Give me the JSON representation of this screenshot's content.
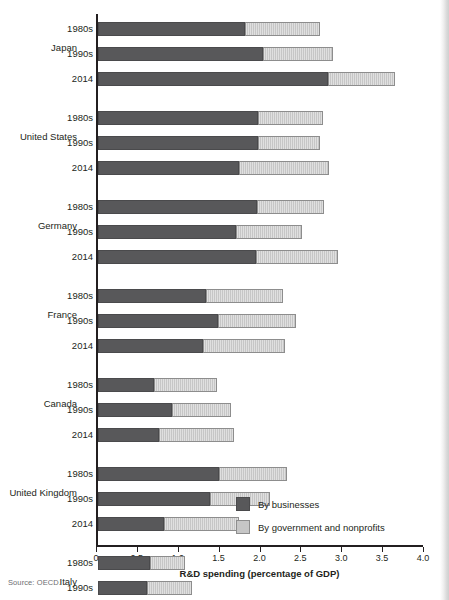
{
  "source_note": "Source: OECD.",
  "legend": {
    "position": "inside-bottom-right",
    "items": [
      {
        "label": "By businesses",
        "color": "#58585a",
        "icon": "legend-swatch"
      },
      {
        "label": "By government and nonprofits",
        "color": "#c6c6c6",
        "icon": "legend-swatch"
      }
    ]
  },
  "chart_data": {
    "type": "bar",
    "orientation": "horizontal",
    "stacked": true,
    "title": "",
    "xlabel": "R&D spending (percentage of GDP)",
    "ylabel": "",
    "xlim": [
      0,
      4.0
    ],
    "xticks": [
      "0",
      "0.5",
      "1.0",
      "1.5",
      "2.0",
      "2.5",
      "3.0",
      "3.5",
      "4.0"
    ],
    "xtick_values": [
      0,
      0.5,
      1.0,
      1.5,
      2.0,
      2.5,
      3.0,
      3.5,
      4.0
    ],
    "grid": false,
    "series": [
      {
        "name": "By businesses",
        "color": "#58585a"
      },
      {
        "name": "By government and nonprofits",
        "color": "#c6c6c6"
      }
    ],
    "groups": [
      {
        "country": "Japan",
        "rows": [
          {
            "period": "1980s",
            "business": 1.8,
            "government": 0.92,
            "total": 2.72
          },
          {
            "period": "1990s",
            "business": 2.02,
            "government": 0.85,
            "total": 2.87
          },
          {
            "period": "2014",
            "business": 2.81,
            "government": 0.82,
            "total": 3.63
          }
        ]
      },
      {
        "country": "United States",
        "rows": [
          {
            "period": "1980s",
            "business": 1.96,
            "government": 0.79,
            "total": 2.75
          },
          {
            "period": "1990s",
            "business": 1.96,
            "government": 0.76,
            "total": 2.72
          },
          {
            "period": "2014",
            "business": 1.73,
            "government": 1.09,
            "total": 2.82
          }
        ]
      },
      {
        "country": "Germany",
        "rows": [
          {
            "period": "1980s",
            "business": 1.94,
            "government": 0.82,
            "total": 2.76
          },
          {
            "period": "1990s",
            "business": 1.69,
            "government": 0.81,
            "total": 2.5
          },
          {
            "period": "2014",
            "business": 1.93,
            "government": 1.01,
            "total": 2.94
          }
        ]
      },
      {
        "country": "France",
        "rows": [
          {
            "period": "1980s",
            "business": 1.32,
            "government": 0.94,
            "total": 2.26
          },
          {
            "period": "1990s",
            "business": 1.47,
            "government": 0.95,
            "total": 2.42
          },
          {
            "period": "2014",
            "business": 1.28,
            "government": 1.01,
            "total": 2.29
          }
        ]
      },
      {
        "country": "Canada",
        "rows": [
          {
            "period": "1980s",
            "business": 0.69,
            "government": 0.77,
            "total": 1.46
          },
          {
            "period": "1990s",
            "business": 0.91,
            "government": 0.72,
            "total": 1.63
          },
          {
            "period": "2014",
            "business": 0.75,
            "government": 0.91,
            "total": 1.66
          }
        ]
      },
      {
        "country": "United Kingdom",
        "rows": [
          {
            "period": "1980s",
            "business": 1.48,
            "government": 0.83,
            "total": 2.31
          },
          {
            "period": "1990s",
            "business": 1.37,
            "government": 0.73,
            "total": 2.1
          },
          {
            "period": "2014",
            "business": 0.81,
            "government": 0.92,
            "total": 1.73
          }
        ]
      },
      {
        "country": "Italy",
        "rows": [
          {
            "period": "1980s",
            "business": 0.64,
            "government": 0.42,
            "total": 1.06
          },
          {
            "period": "1990s",
            "business": 0.6,
            "government": 0.55,
            "total": 1.15
          },
          {
            "period": "2014",
            "business": 0.66,
            "government": 0.78,
            "total": 1.44
          }
        ]
      }
    ]
  }
}
